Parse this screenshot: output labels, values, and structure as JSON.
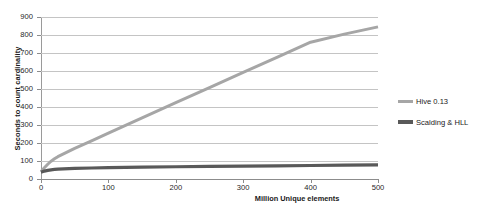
{
  "chart_data": {
    "type": "line",
    "title": "",
    "xlabel": "Million Unique elements",
    "ylabel": "Seconds to count cardinality",
    "xlim": [
      0,
      500
    ],
    "ylim": [
      0,
      900
    ],
    "grid": true,
    "legend_position": "right",
    "x_ticks": [
      "0",
      "100",
      "200",
      "300",
      "400",
      "500"
    ],
    "y_ticks": [
      "0",
      "100",
      "200",
      "300",
      "400",
      "500",
      "600",
      "700",
      "800",
      "900"
    ],
    "x": [
      0,
      5,
      10,
      15,
      20,
      25,
      50,
      75,
      100,
      150,
      200,
      250,
      300,
      350,
      400,
      450,
      500
    ],
    "series": [
      {
        "name": "Hive 0.13",
        "color": "#a6a6a6",
        "values": [
          40,
          62,
          82,
          99,
          112,
          124,
          170,
          212,
          255,
          340,
          424,
          508,
          592,
          676,
          760,
          805,
          845
        ]
      },
      {
        "name": "Scalding & HLL",
        "color": "#595959",
        "values": [
          38,
          44,
          48,
          51,
          53,
          55,
          59,
          61,
          63,
          66,
          68,
          70,
          72,
          73,
          75,
          77,
          78
        ]
      }
    ]
  },
  "legend": {
    "items": [
      {
        "label": "Hive 0.13"
      },
      {
        "label": "Scalding & HLL"
      }
    ]
  }
}
